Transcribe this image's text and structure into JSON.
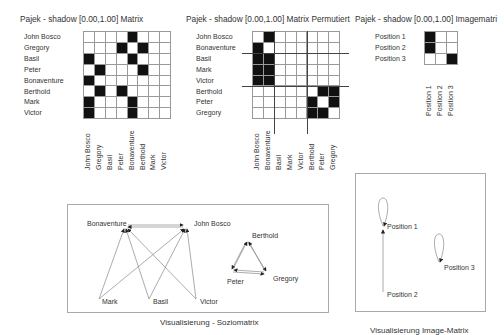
{
  "matrix": {
    "title": "Pajek - shadow [0.00,1.00] Matrix",
    "labels": [
      "John Bosco",
      "Gregory",
      "Basil",
      "Peter",
      "Bonaventure",
      "Berthold",
      "Mark",
      "Victor"
    ],
    "cells": [
      [
        0,
        0,
        0,
        0,
        1,
        0,
        0,
        0
      ],
      [
        0,
        0,
        0,
        1,
        0,
        1,
        0,
        0
      ],
      [
        1,
        0,
        0,
        0,
        1,
        0,
        0,
        0
      ],
      [
        0,
        1,
        0,
        0,
        0,
        1,
        0,
        0
      ],
      [
        1,
        0,
        0,
        0,
        0,
        0,
        0,
        0
      ],
      [
        0,
        1,
        0,
        1,
        0,
        0,
        0,
        0
      ],
      [
        1,
        0,
        0,
        0,
        1,
        0,
        0,
        0
      ],
      [
        1,
        0,
        0,
        0,
        1,
        0,
        0,
        0
      ]
    ]
  },
  "permuted": {
    "title": "Pajek - shadow [0.00,1.00] Matrix Permutiert",
    "labels": [
      "John Bosco",
      "Bonaventure",
      "Basil",
      "Mark",
      "Victor",
      "Berthold",
      "Peter",
      "Gregory"
    ],
    "cells": [
      [
        0,
        1,
        0,
        0,
        0,
        0,
        0,
        0
      ],
      [
        1,
        0,
        0,
        0,
        0,
        0,
        0,
        0
      ],
      [
        1,
        1,
        0,
        0,
        0,
        0,
        0,
        0
      ],
      [
        1,
        1,
        0,
        0,
        0,
        0,
        0,
        0
      ],
      [
        1,
        1,
        0,
        0,
        0,
        0,
        0,
        0
      ],
      [
        0,
        0,
        0,
        0,
        0,
        0,
        1,
        1
      ],
      [
        0,
        0,
        0,
        0,
        0,
        1,
        0,
        1
      ],
      [
        0,
        0,
        0,
        0,
        0,
        1,
        1,
        0
      ]
    ],
    "partitions_after": [
      1,
      4
    ]
  },
  "image_matrix": {
    "title": "Pajek - shadow [0.00,1.00] Imagematri",
    "labels": [
      "Position 1",
      "Position 2",
      "Position 3"
    ],
    "cells": [
      [
        1,
        0,
        0
      ],
      [
        1,
        0,
        0
      ],
      [
        0,
        0,
        1
      ]
    ]
  },
  "sociogram": {
    "caption": "Visualisierung - Soziomatrix",
    "nodes": {
      "bonaventure": "Bonaventure",
      "john_bosco": "John Bosco",
      "mark": "Mark",
      "basil": "Basil",
      "victor": "Victor",
      "berthold": "Berthold",
      "peter": "Peter",
      "gregory": "Gregory"
    }
  },
  "image_graph": {
    "caption": "Visualisierung Image-Matrix",
    "nodes": {
      "p1": "Position 1",
      "p2": "Position 2",
      "p3": "Position 3"
    }
  }
}
